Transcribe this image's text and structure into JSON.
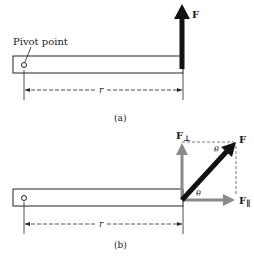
{
  "figure": {
    "panel_a": {
      "caption": "(a)",
      "pivot_label": "Pivot point",
      "force_label": "F",
      "distance_label": "r"
    },
    "panel_b": {
      "caption": "(b)",
      "force_label": "F",
      "perp_label": "F",
      "perp_subscript": "⊥",
      "par_label": "F",
      "par_subscript": "∥",
      "angle_label_1": "θ",
      "angle_label_2": "θ",
      "distance_label": "r"
    },
    "colors": {
      "force": "#111111",
      "component": "#8a8a8a",
      "line": "#222222"
    }
  }
}
